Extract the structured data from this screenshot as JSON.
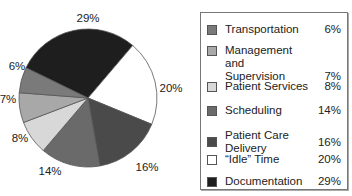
{
  "chart_data": {
    "type": "pie",
    "title": "",
    "slices": [
      {
        "label": "Transportation",
        "value": 6,
        "display": "6%",
        "color": "#7a7a7a"
      },
      {
        "label": "Management and Supervision",
        "value": 7,
        "display": "7%",
        "color": "#a8a8a8"
      },
      {
        "label": "Patient Services",
        "value": 8,
        "display": "8%",
        "color": "#d8d8d8"
      },
      {
        "label": "Scheduling",
        "value": 14,
        "display": "14%",
        "color": "#6a6a6a"
      },
      {
        "label": "Patient Care Delivery",
        "value": 16,
        "display": "16%",
        "color": "#4a4a4a"
      },
      {
        "label": "“Idle” Time",
        "value": 20,
        "display": "20%",
        "color": "#ffffff"
      },
      {
        "label": "Documentation",
        "value": 29,
        "display": "29%",
        "color": "#1e1e1e"
      }
    ],
    "legend_position": "right"
  },
  "legend": {
    "items": [
      {
        "label": "Transportation",
        "value": "6%"
      },
      {
        "label": "Management and\nSupervision",
        "value": "7%"
      },
      {
        "label": "Patient Services",
        "value": "8%"
      },
      {
        "label": "Scheduling",
        "value": "14%"
      },
      {
        "label": "Patient Care Delivery",
        "value": "16%"
      },
      {
        "label": "“Idle” Time",
        "value": "20%"
      },
      {
        "label": "Documentation",
        "value": "29%"
      }
    ]
  }
}
